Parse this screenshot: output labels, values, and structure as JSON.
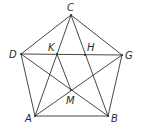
{
  "diagram": {
    "title": "",
    "points": {
      "C": {
        "label": "C",
        "x": 71,
        "y": 15,
        "lx": 67,
        "ly": 11
      },
      "D": {
        "label": "D",
        "x": 21,
        "y": 54,
        "lx": 9,
        "ly": 58
      },
      "G": {
        "label": "G",
        "x": 122,
        "y": 55,
        "lx": 125,
        "ly": 59
      },
      "A": {
        "label": "A",
        "x": 35,
        "y": 116,
        "lx": 25,
        "ly": 122
      },
      "B": {
        "label": "B",
        "x": 108,
        "y": 116,
        "lx": 111,
        "ly": 122
      },
      "K": {
        "label": "K",
        "x": 57,
        "y": 54,
        "lx": 48,
        "ly": 51
      },
      "H": {
        "label": "H",
        "x": 85,
        "y": 55,
        "lx": 87,
        "ly": 51
      },
      "M": {
        "label": "M",
        "x": 71,
        "y": 90,
        "lx": 66,
        "ly": 104
      }
    },
    "segments": [
      [
        "C",
        "D"
      ],
      [
        "D",
        "A"
      ],
      [
        "A",
        "B"
      ],
      [
        "B",
        "G"
      ],
      [
        "G",
        "C"
      ],
      [
        "D",
        "G"
      ],
      [
        "C",
        "A"
      ],
      [
        "C",
        "B"
      ],
      [
        "D",
        "B"
      ],
      [
        "A",
        "G"
      ],
      [
        "K",
        "M"
      ]
    ],
    "colors": {
      "line": "#333333",
      "label": "#2a2a2a",
      "background": "#ffffff"
    }
  }
}
